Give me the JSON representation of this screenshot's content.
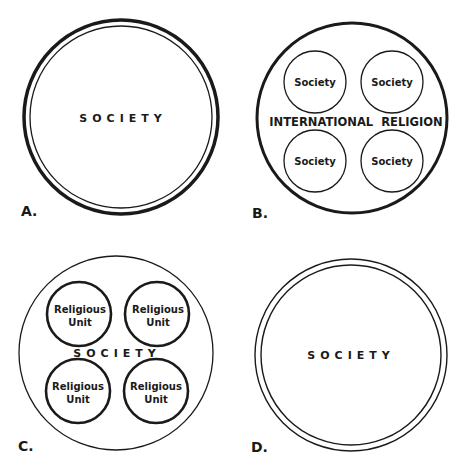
{
  "panels": {
    "a": {
      "letter": "A.",
      "center_label": "SOCIETY",
      "style": "thick outer ring with thin inner ring"
    },
    "b": {
      "letter": "B.",
      "center_label": "INTERNATIONAL  RELIGION",
      "inner_labels": [
        "Society",
        "Society",
        "Society",
        "Society"
      ],
      "style": "thick outer circle containing four thin circles"
    },
    "c": {
      "letter": "C.",
      "center_label": "SOCIETY",
      "inner_labels": [
        {
          "line1": "Religious",
          "line2": "Unit"
        },
        {
          "line1": "Religious",
          "line2": "Unit"
        },
        {
          "line1": "Religious",
          "line2": "Unit"
        },
        {
          "line1": "Religious",
          "line2": "Unit"
        }
      ],
      "style": "thin outer circle containing four thick circles"
    },
    "d": {
      "letter": "D.",
      "center_label": "SOCIETY",
      "style": "two thin concentric circles"
    }
  },
  "colors": {
    "stroke": "#1a1a1a",
    "background": "#ffffff"
  }
}
